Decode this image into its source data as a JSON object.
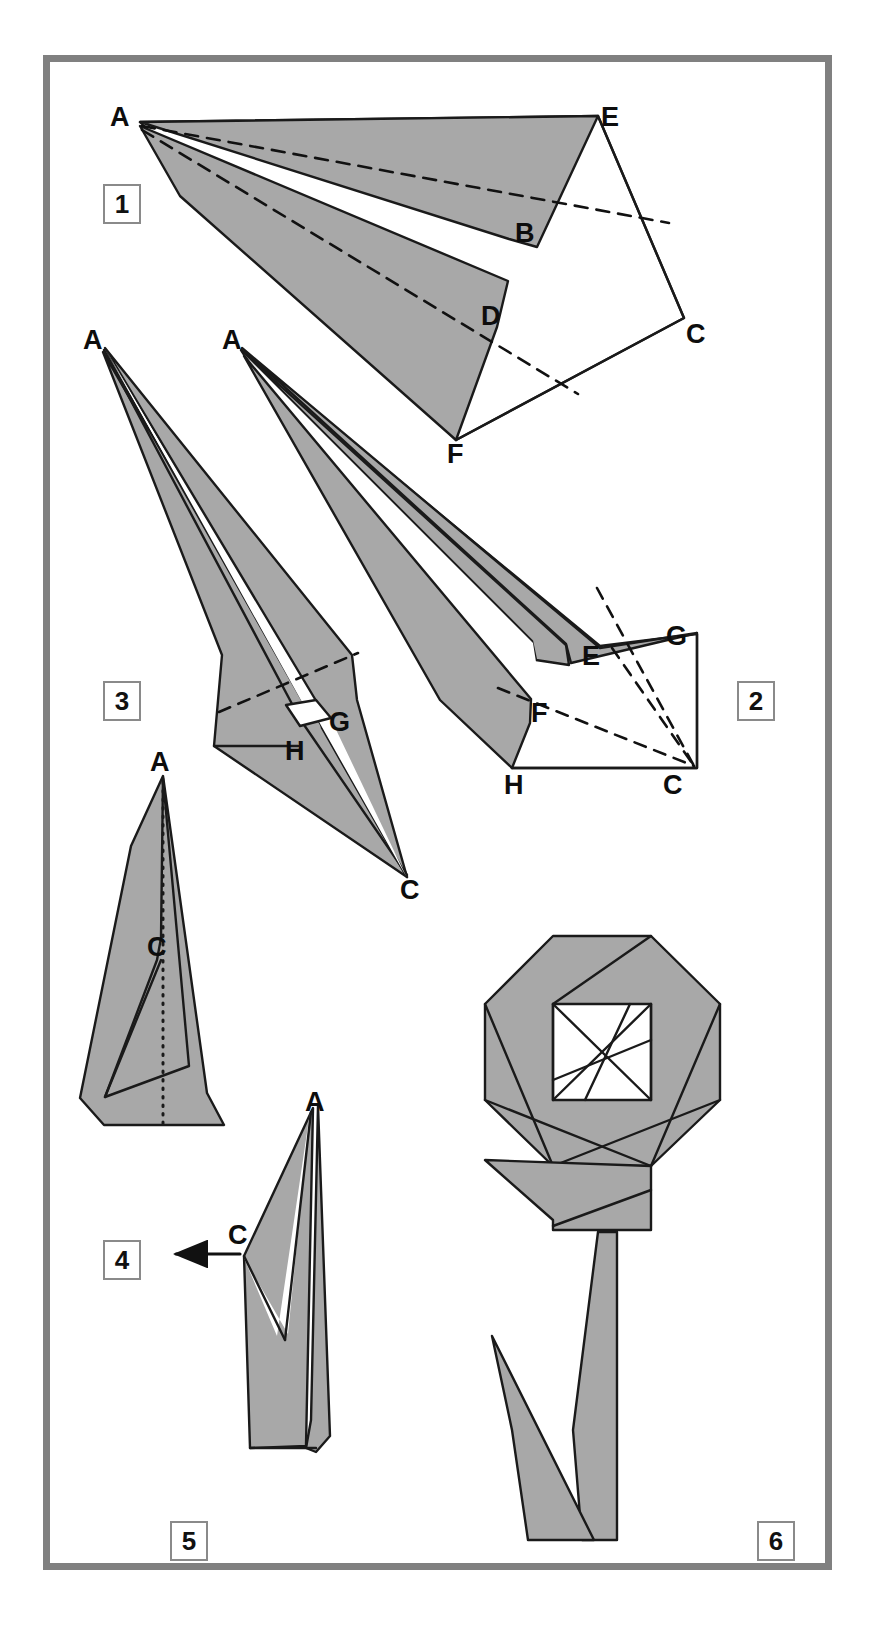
{
  "diagram": {
    "kind": "origami-fold-instructions",
    "steps_count": 6,
    "paper_fill": "#a8a8a8",
    "paper_stroke": "#1a1a1a",
    "frame_color": "#808080",
    "background": "#ffffff"
  },
  "steps": [
    {
      "number": "1",
      "box": {
        "x": 103,
        "y": 184
      }
    },
    {
      "number": "2",
      "box": {
        "x": 737,
        "y": 681
      }
    },
    {
      "number": "3",
      "box": {
        "x": 103,
        "y": 681
      }
    },
    {
      "number": "4",
      "box": {
        "x": 103,
        "y": 1240
      }
    },
    {
      "number": "5",
      "box": {
        "x": 170,
        "y": 1521
      }
    },
    {
      "number": "6",
      "box": {
        "x": 757,
        "y": 1521
      }
    }
  ],
  "labels": [
    {
      "id": "s1-A",
      "text": "A",
      "x": 110,
      "y": 104,
      "step": "1"
    },
    {
      "id": "s1-E",
      "text": "E",
      "x": 601,
      "y": 104,
      "step": "1"
    },
    {
      "id": "s1-B",
      "text": "B",
      "x": 515,
      "y": 220,
      "step": "1"
    },
    {
      "id": "s1-C",
      "text": "C",
      "x": 686,
      "y": 321,
      "step": "1"
    },
    {
      "id": "s1-D",
      "text": "D",
      "x": 481,
      "y": 303,
      "step": "1"
    },
    {
      "id": "s1-F",
      "text": "F",
      "x": 447,
      "y": 441,
      "step": "1"
    },
    {
      "id": "s3-A",
      "text": "A",
      "x": 83,
      "y": 327,
      "step": "3"
    },
    {
      "id": "s3-G",
      "text": "G",
      "x": 329,
      "y": 709,
      "step": "3"
    },
    {
      "id": "s3-H",
      "text": "H",
      "x": 285,
      "y": 738,
      "step": "3"
    },
    {
      "id": "s3-C",
      "text": "C",
      "x": 400,
      "y": 877,
      "step": "3"
    },
    {
      "id": "s2-A",
      "text": "A",
      "x": 222,
      "y": 327,
      "step": "2"
    },
    {
      "id": "s2-G",
      "text": "G",
      "x": 666,
      "y": 623,
      "step": "2"
    },
    {
      "id": "s2-E",
      "text": "E",
      "x": 582,
      "y": 643,
      "step": "2"
    },
    {
      "id": "s2-F",
      "text": "F",
      "x": 531,
      "y": 700,
      "step": "2"
    },
    {
      "id": "s2-H",
      "text": "H",
      "x": 504,
      "y": 772,
      "step": "2"
    },
    {
      "id": "s2-C",
      "text": "C",
      "x": 663,
      "y": 772,
      "step": "2"
    },
    {
      "id": "s4-A",
      "text": "A",
      "x": 150,
      "y": 749,
      "step": "4"
    },
    {
      "id": "s4-C",
      "text": "C",
      "x": 147,
      "y": 934,
      "step": "4"
    },
    {
      "id": "s5-A",
      "text": "A",
      "x": 305,
      "y": 1089,
      "step": "5"
    },
    {
      "id": "s5-C",
      "text": "C",
      "x": 228,
      "y": 1222,
      "step": "5"
    }
  ],
  "annotations": {
    "step5_arrow": {
      "label": "fold-direction-arrow",
      "from_x": 240,
      "to_x": 172,
      "y": 1254
    },
    "step4_centerline": {
      "label": "dotted-center-fold-line"
    }
  }
}
